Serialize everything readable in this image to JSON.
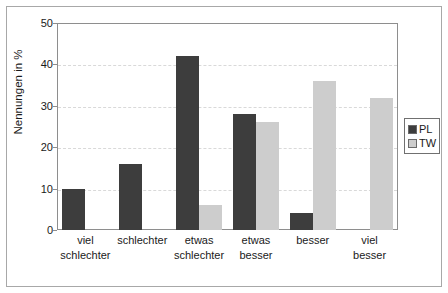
{
  "chart_data": {
    "type": "bar",
    "title": "",
    "subtitle": "",
    "xlabel": "",
    "ylabel": "Nennungen in %",
    "ylim": [
      0,
      50
    ],
    "yticks": [
      0,
      10,
      20,
      30,
      40,
      50
    ],
    "ytick_labels": [
      "0",
      "10",
      "20",
      "30",
      "40",
      "50"
    ],
    "grid": "horizontal-dashed",
    "legend_position": "right-outside",
    "categories": [
      "viel schlechter",
      "schlechter",
      "etwas schlechter",
      "etwas besser",
      "besser",
      "viel besser"
    ],
    "category_lines": [
      [
        "viel",
        "schlechter"
      ],
      [
        "schlechter",
        ""
      ],
      [
        "etwas",
        "schlechter"
      ],
      [
        "etwas",
        "besser"
      ],
      [
        "besser",
        ""
      ],
      [
        "viel",
        "besser"
      ]
    ],
    "series": [
      {
        "name": "PL",
        "color": "#3d3d3d",
        "values": [
          10,
          16,
          42,
          28,
          4,
          0
        ]
      },
      {
        "name": "TW",
        "color": "#cdcdcd",
        "values": [
          0,
          0,
          6,
          26,
          36,
          32
        ]
      }
    ]
  },
  "legend": {
    "items": [
      {
        "label": "PL",
        "color": "#3d3d3d"
      },
      {
        "label": "TW",
        "color": "#cdcdcd"
      }
    ]
  },
  "axes": {
    "y_title": "Nennungen in %",
    "y_tick_0": "0",
    "y_tick_1": "10",
    "y_tick_2": "20",
    "y_tick_3": "30",
    "y_tick_4": "40",
    "y_tick_5": "50"
  },
  "xlabels": {
    "c0_l1": "viel",
    "c0_l2": "schlechter",
    "c1_l1": "schlechter",
    "c1_l2": "",
    "c2_l1": "etwas",
    "c2_l2": "schlechter",
    "c3_l1": "etwas",
    "c3_l2": "besser",
    "c4_l1": "besser",
    "c4_l2": "",
    "c5_l1": "viel",
    "c5_l2": "besser"
  }
}
